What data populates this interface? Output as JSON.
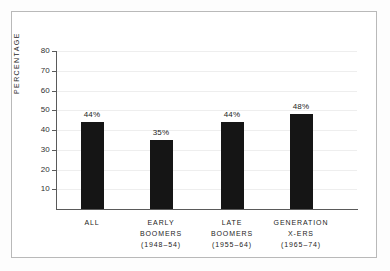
{
  "chart_data": {
    "type": "bar",
    "title": "",
    "xlabel": "",
    "ylabel": "PERCENTAGE",
    "ylim": [
      0,
      80
    ],
    "ytick_step": 10,
    "grid": true,
    "legend": null,
    "categories": [
      "ALL",
      "EARLY BOOMERS (1948–54)",
      "LATE BOOMERS (1955–64)",
      "GENERATION X-ERS (1965–74)"
    ],
    "category_lines": [
      [
        "ALL"
      ],
      [
        "EARLY",
        "BOOMERS",
        "(1948–54)"
      ],
      [
        "LATE",
        "BOOMERS",
        "(1955–64)"
      ],
      [
        "GENERATION",
        "X-ERS",
        "(1965–74)"
      ]
    ],
    "values": [
      44,
      35,
      44,
      48
    ],
    "data_labels": [
      "44%",
      "35%",
      "44%",
      "48%"
    ],
    "yticks": [
      80,
      70,
      60,
      50,
      40,
      30,
      20,
      10
    ],
    "ytick_labels": [
      "80",
      "70",
      "60",
      "50",
      "40",
      "30",
      "20",
      "10"
    ],
    "bar_color": "#151515",
    "axis_color": "#5a5a5a",
    "grid_color": "#eeeeee",
    "background_color": "#ffffff",
    "frame_color": "#b9b9b9"
  }
}
